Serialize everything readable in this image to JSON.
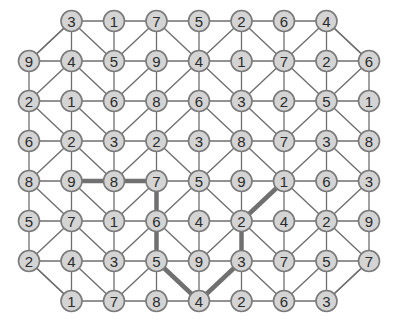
{
  "puzzle": {
    "grid": [
      [
        null,
        3,
        1,
        7,
        5,
        2,
        6,
        4,
        null
      ],
      [
        9,
        4,
        5,
        9,
        4,
        1,
        7,
        2,
        6
      ],
      [
        2,
        1,
        6,
        8,
        6,
        3,
        2,
        5,
        1
      ],
      [
        6,
        2,
        3,
        2,
        3,
        8,
        7,
        3,
        8
      ],
      [
        8,
        9,
        8,
        7,
        5,
        9,
        1,
        6,
        3
      ],
      [
        5,
        7,
        1,
        6,
        4,
        2,
        4,
        2,
        9
      ],
      [
        2,
        4,
        3,
        5,
        9,
        3,
        7,
        5,
        7
      ],
      [
        null,
        1,
        7,
        8,
        4,
        2,
        6,
        3,
        null
      ]
    ],
    "diagonals": [
      [
        "/",
        "\\",
        "/",
        "\\",
        "/",
        "\\",
        "/",
        "\\"
      ],
      [
        "/",
        "\\",
        "/",
        "/",
        "\\",
        "/",
        "\\",
        "/"
      ],
      [
        "\\",
        "\\",
        "/",
        "/",
        "\\",
        "\\",
        "/",
        "\\"
      ],
      [
        "/",
        "\\",
        "/",
        "\\",
        "/",
        "\\",
        "/",
        "\\"
      ],
      [
        "\\",
        "\\",
        "/",
        "/",
        "\\",
        "/",
        "\\",
        "/"
      ],
      [
        "/",
        "\\",
        "/",
        "\\",
        "/",
        "\\",
        "/",
        "\\"
      ],
      [
        "\\",
        "\\",
        "/",
        "\\",
        "/",
        "\\",
        "/",
        "/"
      ]
    ],
    "highlighted_path": [
      [
        4,
        1
      ],
      [
        4,
        2
      ],
      [
        4,
        3
      ],
      [
        5,
        3
      ],
      [
        6,
        3
      ],
      [
        7,
        4
      ],
      [
        6,
        5
      ],
      [
        5,
        5
      ],
      [
        4,
        6
      ]
    ],
    "path_values": [
      9,
      8,
      7,
      6,
      5,
      4,
      3,
      2,
      1
    ]
  },
  "layout": {
    "col_x": [
      29,
      71.5,
      114,
      156.5,
      199,
      241.5,
      284,
      326.5,
      369
    ],
    "row_y": [
      21,
      61,
      101,
      141,
      181,
      221,
      261,
      301
    ],
    "node_radius": 10.5
  },
  "colors": {
    "node_fill": "#d4d4d4",
    "node_stroke": "#7a7a7a",
    "edge": "#6e6e6e",
    "path": "#707070",
    "text": "#2a2a2a"
  }
}
